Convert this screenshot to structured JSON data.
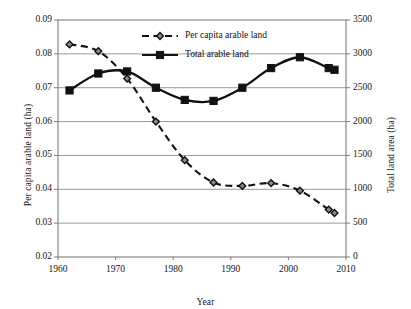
{
  "chart_data": {
    "type": "line",
    "title": "",
    "xlabel": "Year",
    "ylabel": "Per capita arable land (ha)",
    "ylabel_secondary": "Total land area (ha)",
    "grid": true,
    "legend_position": "top-center",
    "xlim": [
      1960,
      2010
    ],
    "xticks": [
      1960,
      1970,
      1980,
      1990,
      2000,
      2010
    ],
    "xtick_labels": [
      "1960",
      "1970",
      "1980",
      "1990",
      "2000",
      "2010"
    ],
    "ylim": [
      0.02,
      0.09
    ],
    "yticks": [
      0.02,
      0.03,
      0.04,
      0.05,
      0.06,
      0.07,
      0.08,
      0.09
    ],
    "ytick_labels": [
      "0.02",
      "0.03",
      "0.04",
      "0.05",
      "0.06",
      "0.07",
      "0.08",
      "0.09"
    ],
    "ylim_secondary": [
      0,
      3500
    ],
    "yticks_secondary": [
      0,
      500,
      1000,
      1500,
      2000,
      2500,
      3000,
      3500
    ],
    "ytick_labels_secondary": [
      "0",
      "500",
      "1000",
      "1500",
      "2000",
      "2500",
      "3000",
      "3500"
    ],
    "x": [
      1962,
      1967,
      1972,
      1977,
      1982,
      1987,
      1992,
      1997,
      2002,
      2007,
      2008
    ],
    "series": [
      {
        "name": "Per capita arable land",
        "axis": "left",
        "line_style": "dashed",
        "marker": "diamond",
        "color": "#111111",
        "values": [
          0.0828,
          0.0808,
          0.0727,
          0.06,
          0.0486,
          0.042,
          0.041,
          0.0418,
          0.0396,
          0.034,
          0.033
        ]
      },
      {
        "name": "Total arable land",
        "axis": "right",
        "line_style": "solid",
        "marker": "square",
        "color": "#111111",
        "values": [
          2460,
          2710,
          2740,
          2500,
          2320,
          2305,
          2500,
          2790,
          2950,
          2790,
          2765
        ]
      }
    ]
  },
  "legend": {
    "entries": [
      {
        "label": "Per capita arable land"
      },
      {
        "label": "Total arable land"
      }
    ]
  },
  "colors": {
    "line": "#111111",
    "grid": "#8d8d8d",
    "frame": "#7d7d7d",
    "text": "#161616"
  }
}
